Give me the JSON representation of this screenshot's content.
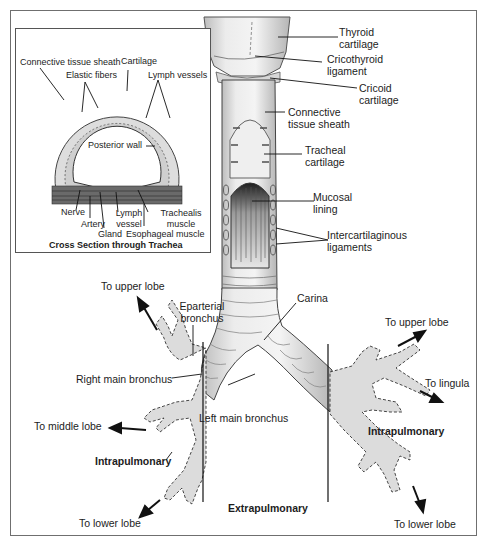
{
  "figure": {
    "inset": {
      "caption": "Cross Section through Trachea",
      "labels": {
        "connective_tissue_sheath": "Connective tissue sheath",
        "cartilage": "Cartilage",
        "elastic_fibers": "Elastic fibers",
        "lymph_vessels": "Lymph vessels",
        "posterior_wall": "Posterior wall",
        "nerve": "Nerve",
        "artery": "Artery",
        "gland": "Gland",
        "lymph_vessel": "Lymph vessel",
        "trachealis_muscle": "Trachealis muscle",
        "esophageal_muscle": "Esophageal muscle"
      }
    },
    "trachea_labels": {
      "thyroid_cartilage": "Thyroid cartilage",
      "cricothyroid_ligament": "Cricothyroid ligament",
      "cricoid_cartilage": "Cricoid cartilage",
      "connective_tissue_sheath": "Connective tissue sheath",
      "tracheal_cartilage": "Tracheal cartilage",
      "mucosal_lining": "Mucosal lining",
      "intercartilaginous_ligaments": "Intercartilaginous ligaments",
      "carina": "Carina"
    },
    "bronchi_labels": {
      "eparterial_bronchus": "Eparterial bronchus",
      "right_main_bronchus": "Right main bronchus",
      "left_main_bronchus": "Left main bronchus",
      "right_to_upper_lobe": "To upper lobe",
      "right_to_middle_lobe": "To middle lobe",
      "right_to_lower_lobe": "To lower lobe",
      "left_to_upper_lobe": "To upper lobe",
      "left_to_lingula": "To lingula",
      "left_to_lower_lobe": "To lower lobe",
      "right_intrapulmonary": "Intrapulmonary",
      "left_intrapulmonary": "Intrapulmonary",
      "extrapulmonary": "Extrapulmonary"
    },
    "colors": {
      "frame_border": "#6f6f6f",
      "tissue_fill": "#e3e3e3",
      "lung_airway_fill": "#d9d9d9",
      "mucosa_dark": "#2a2a2a",
      "text": "#1c1c1c"
    }
  }
}
